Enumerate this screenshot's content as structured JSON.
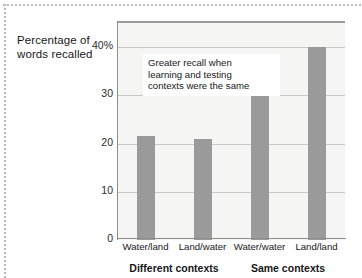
{
  "chart_data": {
    "type": "bar",
    "title": "",
    "ylabel": "Percentage of words recalled",
    "xlabel": "",
    "categories": [
      "Water/land",
      "Land/water",
      "Water/water",
      "Land/land"
    ],
    "values": [
      21.5,
      21,
      31,
      40
    ],
    "ylim": [
      0,
      45
    ],
    "yticks": [
      0,
      10,
      20,
      30,
      40
    ],
    "ytick_labels": [
      "0",
      "10",
      "20",
      "30",
      "40%"
    ],
    "grid": true,
    "legend": "none",
    "bar_color": "#9a9a9a",
    "plot_background": "#f5f5f3",
    "annotations": [
      {
        "text": "Greater recall when learning and testing contexts were the same",
        "line1": "Greater recall when",
        "line2": "learning and testing",
        "line3": "contexts were the same"
      }
    ],
    "groups": [
      {
        "label": "Different contexts",
        "categories": [
          "Water/land",
          "Land/water"
        ]
      },
      {
        "label": "Same contexts",
        "categories": [
          "Water/water",
          "Land/land"
        ]
      }
    ]
  },
  "axis": {
    "y_title_line1": "Percentage of",
    "y_title_line2": "words recalled"
  },
  "credit": {
    "text": ""
  }
}
